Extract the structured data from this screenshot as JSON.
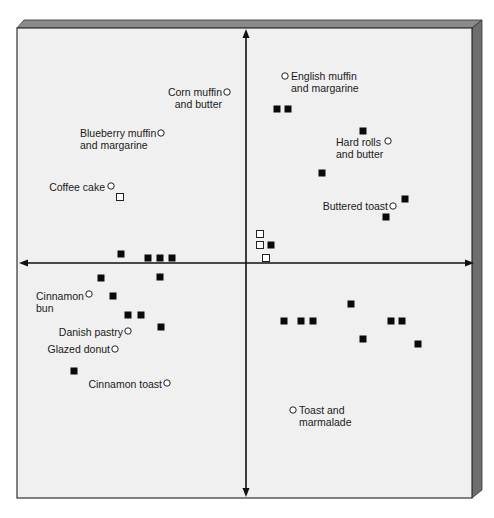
{
  "chart_data": {
    "type": "scatter",
    "title": "",
    "subtitle": "",
    "xlabel": "",
    "ylabel": "",
    "grid": false,
    "legend": null,
    "axes": {
      "style": "perceptual map, centered crossing axes with arrowheads on both ends",
      "x_range": [
        -1,
        1
      ],
      "y_range": [
        -1,
        1
      ],
      "tick_labels": []
    },
    "coordinate_note": "Values are normalized positions relative to axis crossing (x right positive, y up positive), estimated from pixel positions.",
    "series": [
      {
        "name": "Products",
        "marker": "open-circle",
        "points": [
          {
            "label": "Corn muffin\nand butter",
            "x": -0.08,
            "y": 0.73,
            "px": [
              227,
              92
            ],
            "label_side": "left"
          },
          {
            "label": "English muffin\nand margarine",
            "x": 0.17,
            "y": 0.81,
            "px": [
              285,
              76
            ],
            "label_side": "right"
          },
          {
            "label": "Blueberry muffin\nand margarine",
            "x": -0.37,
            "y": 0.56,
            "px": [
              161,
              133
            ],
            "label_side": "left"
          },
          {
            "label": "Hard rolls\nand butter",
            "x": 0.61,
            "y": 0.52,
            "px": [
              388,
              141
            ],
            "label_side": "left"
          },
          {
            "label": "Coffee cake",
            "x": -0.59,
            "y": 0.32,
            "px": [
              111,
              186
            ],
            "label_side": "left"
          },
          {
            "label": "Buttered toast",
            "x": 0.64,
            "y": 0.24,
            "px": [
              393,
              206
            ],
            "label_side": "left"
          },
          {
            "label": "Cinnamon\nbun",
            "x": -0.69,
            "y": -0.13,
            "px": [
              89,
              294
            ],
            "label_side": "left"
          },
          {
            "label": "Danish pastry",
            "x": -0.52,
            "y": -0.29,
            "px": [
              128,
              331
            ],
            "label_side": "left"
          },
          {
            "label": "Glazed donut",
            "x": -0.58,
            "y": -0.37,
            "px": [
              115,
              349
            ],
            "label_side": "left"
          },
          {
            "label": "Cinnamon toast",
            "x": -0.35,
            "y": -0.52,
            "px": [
              167,
              383
            ],
            "label_side": "left"
          },
          {
            "label": "Toast and\nmarmalade",
            "x": 0.21,
            "y": -0.64,
            "px": [
              293,
              410
            ],
            "label_side": "right"
          }
        ]
      },
      {
        "name": "Ideal points (segments)",
        "marker": "filled-square",
        "points": [
          {
            "x": 0.14,
            "y": 0.66,
            "px": [
              277,
              109
            ]
          },
          {
            "x": 0.19,
            "y": 0.66,
            "px": [
              288,
              109
            ]
          },
          {
            "x": 0.52,
            "y": 0.56,
            "px": [
              363,
              131
            ]
          },
          {
            "x": 0.34,
            "y": 0.39,
            "px": [
              322,
              173
            ]
          },
          {
            "x": 0.71,
            "y": 0.27,
            "px": [
              405,
              199
            ]
          },
          {
            "x": 0.62,
            "y": 0.19,
            "px": [
              386,
              217
            ]
          },
          {
            "x": 0.11,
            "y": 0.08,
            "px": [
              271,
              245
            ]
          },
          {
            "x": -0.56,
            "y": 0.04,
            "px": [
              121,
              254
            ]
          },
          {
            "x": -0.44,
            "y": 0.02,
            "px": [
              148,
              258
            ]
          },
          {
            "x": -0.38,
            "y": 0.02,
            "px": [
              160,
              258
            ]
          },
          {
            "x": -0.33,
            "y": 0.02,
            "px": [
              172,
              258
            ]
          },
          {
            "x": -0.65,
            "y": -0.07,
            "px": [
              101,
              278
            ]
          },
          {
            "x": -0.38,
            "y": -0.06,
            "px": [
              160,
              277
            ]
          },
          {
            "x": -0.59,
            "y": -0.14,
            "px": [
              113,
              296
            ]
          },
          {
            "x": -0.53,
            "y": -0.22,
            "px": [
              128,
              315
            ]
          },
          {
            "x": -0.47,
            "y": -0.22,
            "px": [
              141,
              315
            ]
          },
          {
            "x": -0.38,
            "y": -0.27,
            "px": [
              161,
              327
            ]
          },
          {
            "x": -0.76,
            "y": -0.46,
            "px": [
              74,
              371
            ]
          },
          {
            "x": 0.17,
            "y": -0.25,
            "px": [
              284,
              321
            ]
          },
          {
            "x": 0.24,
            "y": -0.25,
            "px": [
              301,
              321
            ]
          },
          {
            "x": 0.3,
            "y": -0.25,
            "px": [
              313,
              321
            ]
          },
          {
            "x": 0.46,
            "y": -0.18,
            "px": [
              351,
              304
            ]
          },
          {
            "x": 0.52,
            "y": -0.32,
            "px": [
              363,
              339
            ]
          },
          {
            "x": 0.64,
            "y": -0.25,
            "px": [
              391,
              321
            ]
          },
          {
            "x": 0.69,
            "y": -0.25,
            "px": [
              402,
              321
            ]
          },
          {
            "x": 0.76,
            "y": -0.34,
            "px": [
              418,
              344
            ]
          }
        ]
      },
      {
        "name": "Other ideal points",
        "marker": "open-square",
        "points": [
          {
            "x": -0.56,
            "y": 0.29,
            "px": [
              120,
              197
            ]
          },
          {
            "x": 0.06,
            "y": 0.12,
            "px": [
              260,
              234
            ]
          },
          {
            "x": 0.06,
            "y": 0.08,
            "px": [
              260,
              245
            ]
          },
          {
            "x": 0.09,
            "y": 0.02,
            "px": [
              266,
              258
            ]
          }
        ]
      }
    ]
  },
  "frame": {
    "face_color": "#f0f0f0",
    "bevel_top_color": "#8a8a8a",
    "bevel_right_color": "#6e6e6e",
    "border_color": "#333333",
    "axis_color": "#111111",
    "marker_color": "#0a0a0a"
  },
  "labels": [
    {
      "id": "corn-muffin",
      "lines": [
        "Corn muffin",
        "and butter"
      ],
      "x": 165,
      "y": 86,
      "align": "right",
      "w": 57
    },
    {
      "id": "english-muffin",
      "lines": [
        "English muffin",
        "and margarine"
      ],
      "x": 291,
      "y": 70,
      "align": "left",
      "w": 80
    },
    {
      "id": "blueberry-muffin",
      "lines": [
        "Blueberry muffin",
        "and margarine"
      ],
      "x": 80,
      "y": 127,
      "align": "left",
      "w": 80
    },
    {
      "id": "hard-rolls",
      "lines": [
        "Hard rolls",
        "and butter"
      ],
      "x": 336,
      "y": 136,
      "align": "left",
      "w": 50
    },
    {
      "id": "coffee-cake",
      "lines": [
        "Coffee cake"
      ],
      "x": 40,
      "y": 181,
      "align": "right",
      "w": 65
    },
    {
      "id": "buttered-toast",
      "lines": [
        "Buttered toast"
      ],
      "x": 320,
      "y": 200,
      "align": "right",
      "w": 68
    },
    {
      "id": "cinnamon-bun",
      "lines": [
        "Cinnamon",
        "bun"
      ],
      "x": 36,
      "y": 290,
      "align": "left",
      "w": 50
    },
    {
      "id": "danish-pastry",
      "lines": [
        "Danish pastry"
      ],
      "x": 55,
      "y": 326,
      "align": "right",
      "w": 68
    },
    {
      "id": "glazed-donut",
      "lines": [
        "Glazed donut"
      ],
      "x": 45,
      "y": 343,
      "align": "right",
      "w": 65
    },
    {
      "id": "cinnamon-toast",
      "lines": [
        "Cinnamon toast"
      ],
      "x": 86,
      "y": 378,
      "align": "right",
      "w": 76
    },
    {
      "id": "toast-marmalade",
      "lines": [
        "Toast and",
        "marmalade"
      ],
      "x": 299,
      "y": 404,
      "align": "left",
      "w": 60
    }
  ]
}
